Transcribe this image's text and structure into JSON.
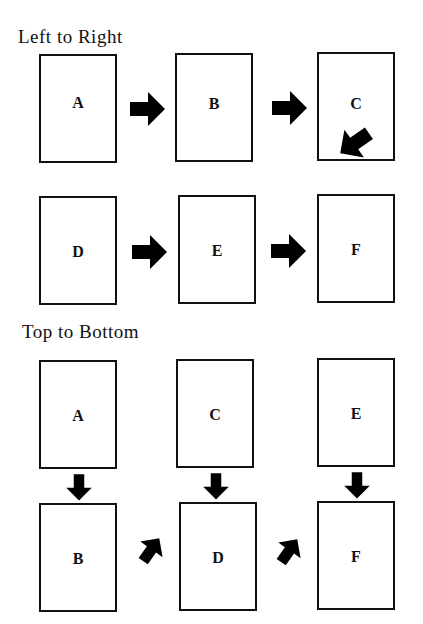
{
  "sections": [
    {
      "title": "Left to Right",
      "boxes": [
        "A",
        "B",
        "C",
        "D",
        "E",
        "F"
      ]
    },
    {
      "title": "Top to Bottom",
      "boxes": [
        "A",
        "C",
        "E",
        "B",
        "D",
        "F"
      ]
    }
  ],
  "colors": {
    "stroke": "#111111",
    "arrow": "#000000",
    "background": "#ffffff"
  }
}
